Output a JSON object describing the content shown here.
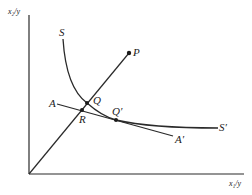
{
  "diagram": {
    "axes": {
      "x_label": "x₁/y",
      "y_label": "x₂/y"
    },
    "curves": {
      "isoquant": {
        "start_label": "S",
        "end_label": "S′"
      },
      "isocost": {
        "start_label": "A",
        "end_label": "A′"
      }
    },
    "points": {
      "P": "P",
      "Q": "Q",
      "Q_prime": "Q′",
      "R": "R"
    },
    "colors": {
      "line": "#2a2a2a",
      "background": "#ffffff"
    }
  }
}
